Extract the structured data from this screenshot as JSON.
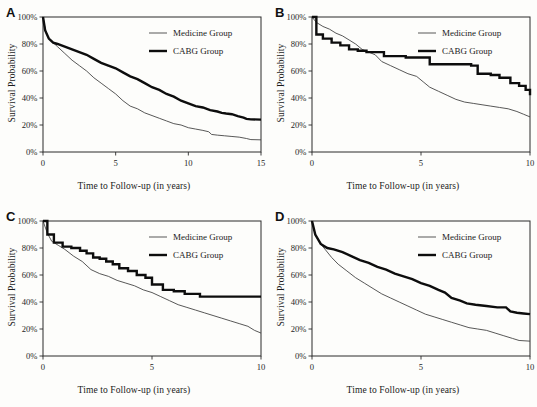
{
  "figure": {
    "background": "#fdfdfb",
    "ink": "#1a1a1a",
    "axis_label_y": "Survival Probability",
    "axis_label_x": "Time to Follow-up (in years)",
    "legend": {
      "medicine": "Medicine Group",
      "cabg": "CABG Group"
    },
    "ytick_labels": [
      "0%",
      "20%",
      "40%",
      "60%",
      "80%",
      "100%"
    ],
    "ytick_values": [
      0,
      20,
      40,
      60,
      80,
      100
    ]
  },
  "chart_data": [
    {
      "panel": "A",
      "type": "line",
      "title": "A",
      "xlabel": "Time to Follow-up (in years)",
      "ylabel": "Survival Probability",
      "xlim": [
        0,
        15
      ],
      "ylim": [
        0,
        100
      ],
      "xticks": [
        0,
        5,
        10,
        15
      ],
      "xtick_labels": [
        "0",
        "5",
        "10",
        "15"
      ],
      "yticks": [
        0,
        20,
        40,
        60,
        80,
        100
      ],
      "ytick_labels": [
        "0%",
        "20%",
        "40%",
        "60%",
        "80%",
        "100%"
      ],
      "grid": false,
      "legend_position": "top-right",
      "series": [
        {
          "name": "Medicine Group",
          "style": "thin",
          "x": [
            0,
            0.15,
            0.35,
            0.6,
            1,
            1.5,
            2,
            2.5,
            3,
            3.5,
            4,
            4.5,
            5,
            5.5,
            6,
            6.5,
            7,
            7.5,
            8,
            8.5,
            9,
            9.5,
            10,
            10.5,
            11,
            11.4,
            11.6,
            12,
            12.5,
            13,
            13.5,
            14,
            14.3,
            15
          ],
          "y": [
            100,
            91,
            85,
            82,
            78,
            73,
            68,
            64,
            60,
            55,
            51,
            47,
            43,
            38,
            34,
            32,
            29,
            27,
            25,
            23,
            21,
            20,
            18,
            17,
            16,
            15,
            13,
            12.5,
            12,
            11.5,
            11,
            10,
            9.2,
            9
          ]
        },
        {
          "name": "CABG Group",
          "style": "thick",
          "x": [
            0,
            0.15,
            0.4,
            0.7,
            1,
            1.5,
            2,
            2.5,
            3,
            3.5,
            4,
            4.5,
            5,
            5.5,
            6,
            6.5,
            7,
            7.5,
            8,
            8.5,
            9,
            9.5,
            10,
            10.5,
            11,
            11.5,
            12,
            12.3,
            12.6,
            13,
            13.4,
            13.8,
            14,
            14.3,
            15
          ],
          "y": [
            100,
            90,
            84,
            81,
            80,
            78,
            76,
            74,
            72,
            69,
            66,
            64,
            62,
            59,
            56,
            54,
            51,
            48,
            46,
            43,
            41,
            38,
            36,
            34,
            33,
            31,
            30,
            29,
            28.5,
            28,
            26.5,
            25.5,
            24.5,
            24.2,
            24
          ]
        }
      ]
    },
    {
      "panel": "B",
      "type": "line",
      "title": "B",
      "xlabel": "Time to Follow-up (in years)",
      "ylabel": "Survival Probability",
      "xlim": [
        0,
        10
      ],
      "ylim": [
        0,
        100
      ],
      "xticks": [
        0,
        5,
        10
      ],
      "xtick_labels": [
        "0",
        "5",
        "10"
      ],
      "yticks": [
        0,
        20,
        40,
        60,
        80,
        100
      ],
      "ytick_labels": [
        "0%",
        "20%",
        "40%",
        "60%",
        "80%",
        "100%"
      ],
      "grid": false,
      "legend_position": "top-right",
      "series": [
        {
          "name": "Medicine Group",
          "style": "thin",
          "x": [
            0,
            0.2,
            0.5,
            0.8,
            1.1,
            1.4,
            1.7,
            2,
            2.3,
            2.6,
            2.9,
            3.2,
            3.6,
            4,
            4.4,
            4.8,
            5.1,
            5.4,
            5.8,
            6.2,
            6.6,
            7,
            7.4,
            7.8,
            8.2,
            8.6,
            9,
            9.4,
            9.7,
            10
          ],
          "y": [
            100,
            96,
            93,
            91,
            88,
            86,
            83,
            80,
            76,
            74,
            72,
            67,
            64,
            61,
            58,
            56,
            52,
            48,
            45,
            42,
            39,
            37,
            36,
            35,
            34,
            33,
            32,
            30,
            28,
            26
          ]
        },
        {
          "name": "CABG Group",
          "style": "thick",
          "step": true,
          "x": [
            0,
            0.2,
            0.5,
            0.9,
            1.3,
            1.7,
            2.1,
            2.5,
            2.9,
            3.3,
            4.3,
            4.9,
            5.4,
            7.3,
            7.6,
            8.2,
            8.6,
            9.1,
            9.5,
            9.8,
            10
          ],
          "y": [
            100,
            87,
            84,
            81,
            79,
            76,
            75,
            74,
            74,
            71,
            70,
            70,
            65,
            64,
            58,
            57,
            55,
            51,
            49,
            46,
            42
          ]
        }
      ]
    },
    {
      "panel": "C",
      "type": "line",
      "title": "C",
      "xlabel": "Time to Follow-up (in years)",
      "ylabel": "Survival Probability",
      "xlim": [
        0,
        10
      ],
      "ylim": [
        0,
        100
      ],
      "xticks": [
        0,
        5,
        10
      ],
      "xtick_labels": [
        "0",
        "5",
        "10"
      ],
      "yticks": [
        0,
        20,
        40,
        60,
        80,
        100
      ],
      "ytick_labels": [
        "0%",
        "20%",
        "40%",
        "60%",
        "80%",
        "100%"
      ],
      "grid": false,
      "legend_position": "top-right",
      "series": [
        {
          "name": "Medicine Group",
          "style": "thin",
          "x": [
            0,
            0.2,
            0.4,
            0.7,
            1,
            1.4,
            1.8,
            2.2,
            2.6,
            3,
            3.4,
            3.8,
            4.2,
            4.6,
            5,
            5.4,
            5.8,
            6.2,
            6.6,
            7,
            7.4,
            7.8,
            8.2,
            8.6,
            9,
            9.4,
            9.7,
            10
          ],
          "y": [
            100,
            91,
            85,
            82,
            79,
            74,
            70,
            64,
            61,
            59,
            56,
            54,
            52,
            49,
            47,
            44,
            41,
            38,
            36,
            34,
            32,
            30,
            28,
            26,
            24,
            22,
            19,
            17
          ]
        },
        {
          "name": "CABG Group",
          "style": "thick",
          "step": true,
          "x": [
            0,
            0.2,
            0.5,
            0.9,
            1.3,
            1.7,
            2,
            2.3,
            2.6,
            2.9,
            3.2,
            3.5,
            3.9,
            4.3,
            4.7,
            5,
            5.5,
            6,
            6.5,
            7.2,
            10
          ],
          "y": [
            100,
            90,
            84,
            81,
            80,
            78,
            76,
            73,
            72,
            70,
            68,
            65,
            63,
            60,
            58,
            53,
            49,
            48,
            46,
            44,
            44
          ]
        }
      ]
    },
    {
      "panel": "D",
      "type": "line",
      "title": "D",
      "xlabel": "Time to Follow-up (in years)",
      "ylabel": "Survival Probability",
      "xlim": [
        0,
        10
      ],
      "ylim": [
        0,
        100
      ],
      "xticks": [
        0,
        5,
        10
      ],
      "xtick_labels": [
        "0",
        "5",
        "10"
      ],
      "yticks": [
        0,
        20,
        40,
        60,
        80,
        100
      ],
      "ytick_labels": [
        "0%",
        "20%",
        "40%",
        "60%",
        "80%",
        "100%"
      ],
      "grid": false,
      "legend_position": "top-right",
      "series": [
        {
          "name": "Medicine Group",
          "style": "thin",
          "x": [
            0,
            0.15,
            0.35,
            0.6,
            0.9,
            1.2,
            1.6,
            2,
            2.4,
            2.8,
            3.2,
            3.6,
            4,
            4.4,
            4.8,
            5.2,
            5.6,
            6,
            6.4,
            6.8,
            7.2,
            7.6,
            8,
            8.4,
            8.8,
            9.2,
            9.5,
            10
          ],
          "y": [
            100,
            90,
            84,
            79,
            73,
            68,
            63,
            58,
            54,
            50,
            46,
            43,
            40,
            37,
            34,
            31,
            29,
            27,
            25,
            23,
            21,
            20,
            19,
            17,
            15,
            13,
            11.5,
            11
          ]
        },
        {
          "name": "CABG Group",
          "style": "thick",
          "x": [
            0,
            0.15,
            0.4,
            0.7,
            1,
            1.4,
            1.8,
            2.2,
            2.6,
            3,
            3.4,
            3.8,
            4.2,
            4.6,
            5,
            5.4,
            5.8,
            6.1,
            6.4,
            6.8,
            7.1,
            7.5,
            8,
            8.5,
            8.9,
            9.1,
            9.4,
            9.7,
            10
          ],
          "y": [
            100,
            90,
            83,
            80,
            79,
            77,
            74,
            71,
            69,
            66,
            64,
            61,
            59,
            57,
            54,
            52,
            49,
            47,
            43,
            41,
            39,
            38,
            37,
            36,
            36,
            33,
            32,
            31.5,
            31
          ]
        }
      ]
    }
  ]
}
